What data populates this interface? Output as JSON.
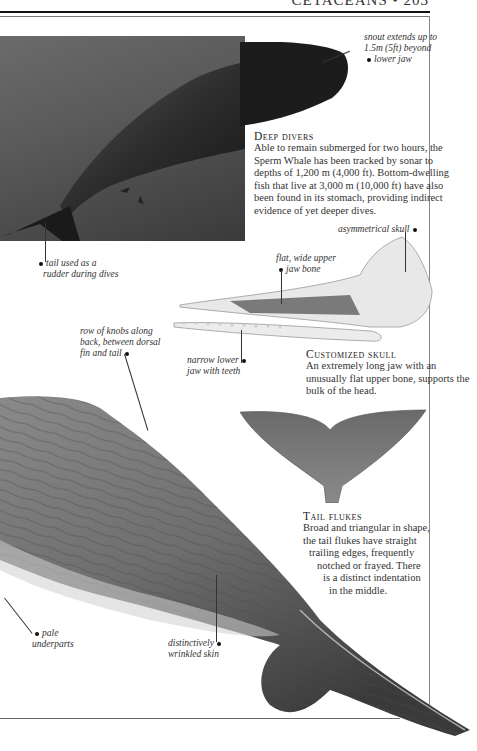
{
  "page": {
    "running_head": "CETACEANS • 203"
  },
  "photo": {
    "subject": "Sperm Whale underwater photograph",
    "callouts": {
      "snout": "snout extends up to 1.5m (5ft) beyond lower jaw",
      "snout_lines": [
        "snout extends up to",
        "1.5m (5ft) beyond",
        "lower jaw"
      ],
      "tail": "tail used as a rudder during dives",
      "tail_lines": [
        "tail used as a",
        "rudder during dives"
      ]
    }
  },
  "sections": {
    "deep_divers": {
      "heading": "Deep divers",
      "body": "Able to remain submerged for two hours, the Sperm Whale has been tracked by sonar to depths of 1,200 m (4,000 ft). Bottom-dwelling fish that live at 3,000 m (10,000 ft) have also been found in its stomach, providing indirect evidence of yet deeper dives."
    },
    "customized_skull": {
      "heading": "Customized skull",
      "body": "An extremely long jaw with an unusually flat upper bone, supports the bulk of the head."
    },
    "tail_flukes": {
      "heading": "Tail flukes",
      "body_lines": [
        "Broad and triangular in shape,",
        "the tail flukes have straight",
        "trailing edges, frequently",
        "notched or frayed. There",
        "is a distinct indentation",
        "in the middle."
      ]
    }
  },
  "skull": {
    "callouts": {
      "asymmetrical": "asymmetrical skull",
      "upper_jaw_lines": [
        "flat, wide upper",
        "jaw bone"
      ],
      "lower_jaw_lines": [
        "narrow lower",
        "jaw with teeth"
      ]
    }
  },
  "body_illustration": {
    "callouts": {
      "knobs_lines": [
        "row of knobs along",
        "back, between dorsal",
        "fin and tail"
      ],
      "underparts_lines": [
        "pale",
        "underparts"
      ],
      "skin_lines": [
        "distinctively",
        "wrinkled skin"
      ]
    }
  }
}
